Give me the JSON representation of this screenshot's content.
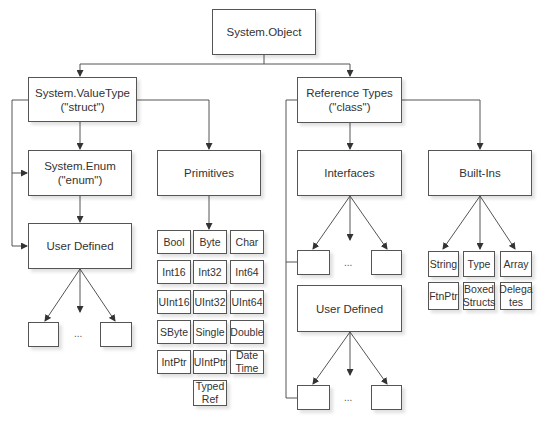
{
  "diagram": {
    "root": {
      "label": "System.Object"
    },
    "value_type": {
      "label": "System.ValueType\n(\"struct\")"
    },
    "enum": {
      "label": "System.Enum\n(\"enum\")"
    },
    "primitives": {
      "label": "Primitives"
    },
    "value_user_defined": {
      "label": "User Defined"
    },
    "reference_types": {
      "label": "Reference Types\n(\"class\")"
    },
    "interfaces": {
      "label": "Interfaces"
    },
    "built_ins": {
      "label": "Built-Ins"
    },
    "ref_user_defined": {
      "label": "User Defined"
    },
    "ellipsis": "...",
    "primitive_types": [
      "Bool",
      "Byte",
      "Char",
      "Int16",
      "Int32",
      "Int64",
      "UInt16",
      "UInt32",
      "UInt64",
      "SByte",
      "Single",
      "Double",
      "IntPtr",
      "UIntPtr",
      "Date\nTime",
      "Typed\nRef"
    ],
    "builtin_types": [
      "String",
      "Type",
      "Array",
      "FtnPtr",
      "Boxed\nStructs",
      "Delega\ntes"
    ]
  }
}
